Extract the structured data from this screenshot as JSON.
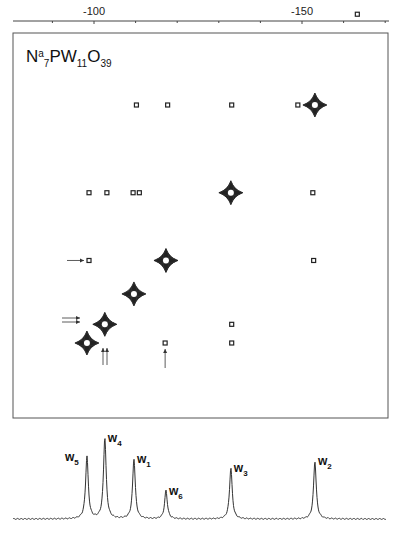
{
  "chart_data": {
    "type": "scatter",
    "title": "Na7PW11O39",
    "title_parts": {
      "n": "N",
      "a": "a",
      "s7": "7",
      "pw": "PW",
      "s11": "11",
      "o": "O",
      "s39": "39"
    },
    "xaxis": {
      "position": "top",
      "range_ppm": [
        -80.8,
        -170.8
      ],
      "major_ticks": [
        -100,
        -150
      ],
      "major_tick_labels": [
        "-100",
        "-150"
      ],
      "minor_ticks": [
        -90,
        -100,
        -110,
        -120,
        -130,
        -140,
        -150,
        -160,
        -170
      ]
    },
    "diagonal_peaks": [
      {
        "label": "W5",
        "ppm": -98.3,
        "intensity": "strong"
      },
      {
        "label": "W4",
        "ppm": -102.6,
        "intensity": "strong"
      },
      {
        "label": "W1",
        "ppm": -109.6,
        "intensity": "strong"
      },
      {
        "label": "W6",
        "ppm": -117.3,
        "intensity": "strong"
      },
      {
        "label": "W3",
        "ppm": -132.9,
        "intensity": "strong"
      },
      {
        "label": "W2",
        "ppm": -153.1,
        "intensity": "strong"
      }
    ],
    "cross_peaks": [
      {
        "f2": -110.2,
        "f1": -153.1
      },
      {
        "f2": -117.7,
        "f1": -153.1
      },
      {
        "f2": -133.1,
        "f1": -153.1
      },
      {
        "f2": -149.0,
        "f1": -153.1
      },
      {
        "f2": -98.8,
        "f1": -132.9
      },
      {
        "f2": -103.1,
        "f1": -132.9
      },
      {
        "f2": -109.4,
        "f1": -132.9
      },
      {
        "f2": -110.9,
        "f1": -132.9
      },
      {
        "f2": -152.6,
        "f1": -132.9
      },
      {
        "f2": -98.8,
        "f1": -117.3,
        "arrow": "left"
      },
      {
        "f2": -152.8,
        "f1": -117.3
      },
      {
        "f2": -133.1,
        "f1": -102.6
      },
      {
        "f2": -117.1,
        "f1": -98.3,
        "arrow": "below"
      },
      {
        "f2": -133.1,
        "f1": -98.3
      },
      {
        "f2": -163.3,
        "f1": -174.0
      }
    ],
    "spectrum_1d": {
      "peaks": [
        {
          "label": "W5",
          "sub": "5",
          "ppm": -98.3,
          "height": 0.77
        },
        {
          "label": "W4",
          "sub": "4",
          "ppm": -102.6,
          "height": 1.0
        },
        {
          "label": "W1",
          "sub": "1",
          "ppm": -109.6,
          "height": 0.74
        },
        {
          "label": "W6",
          "sub": "6",
          "ppm": -117.3,
          "height": 0.35
        },
        {
          "label": "W3",
          "sub": "3",
          "ppm": -132.9,
          "height": 0.63
        },
        {
          "label": "W2",
          "sub": "2",
          "ppm": -153.1,
          "height": 0.71
        }
      ]
    },
    "grid": false,
    "legend": "none"
  }
}
